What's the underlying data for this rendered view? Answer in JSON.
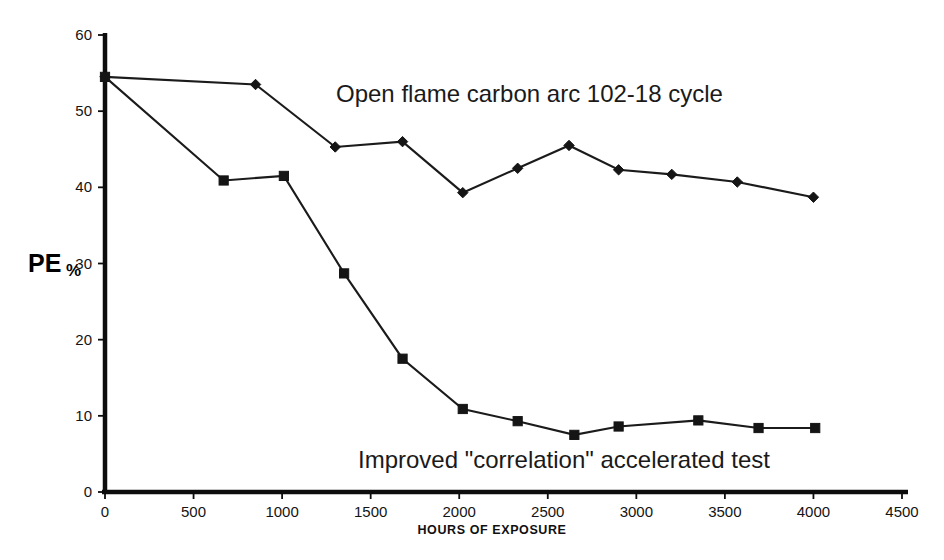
{
  "chart_data": {
    "type": "line",
    "title": "",
    "xlabel": "HOURS OF EXPOSURE",
    "ylabel": "PE%",
    "ylabel_main": "PE",
    "ylabel_suffix": "%",
    "xlim": [
      0,
      4500
    ],
    "ylim": [
      0,
      60
    ],
    "xticks": [
      0,
      500,
      1000,
      1500,
      2000,
      2500,
      3000,
      3500,
      4000,
      4500
    ],
    "xtick_labels": [
      "0",
      "500",
      "1000",
      "1500",
      "2000",
      "2500",
      "3000",
      "3500",
      "4000",
      "4500"
    ],
    "yticks": [
      0,
      10,
      20,
      30,
      40,
      50,
      60
    ],
    "ytick_labels": [
      "0",
      "10",
      "20",
      "30",
      "40",
      "50",
      "60"
    ],
    "grid": false,
    "legend_position": "inline-annotation",
    "series": [
      {
        "name": "Open flame carbon arc 102-18 cycle",
        "marker": "diamond",
        "color": "#151515",
        "x": [
          0,
          850,
          1300,
          1680,
          2020,
          2330,
          2620,
          2900,
          3200,
          3570,
          4000
        ],
        "values": [
          54.5,
          53.5,
          45.3,
          46.0,
          39.3,
          42.5,
          45.5,
          42.3,
          41.7,
          40.7,
          38.7
        ]
      },
      {
        "name": "Improved \"correlation\" accelerated test",
        "marker": "square",
        "color": "#151515",
        "x": [
          0,
          670,
          1010,
          1350,
          1680,
          2020,
          2330,
          2650,
          2900,
          3350,
          3690,
          4010
        ],
        "values": [
          54.5,
          40.9,
          41.5,
          28.7,
          17.5,
          10.9,
          9.3,
          7.5,
          8.6,
          9.4,
          8.4,
          8.4
        ]
      }
    ],
    "annotations": [
      {
        "id": "upper-series-label",
        "text": "Open flame carbon arc 102-18 cycle",
        "x": 1550,
        "y": 52.5
      },
      {
        "id": "lower-series-label",
        "text": "Improved \"correlation\" accelerated test",
        "x": 2100,
        "y": 4.2
      }
    ]
  }
}
